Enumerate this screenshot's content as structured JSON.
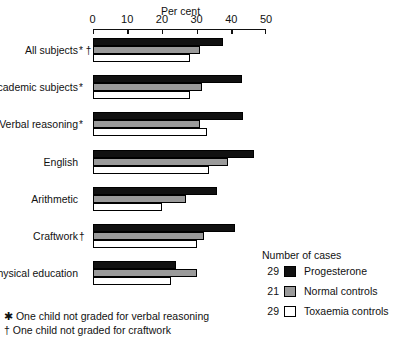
{
  "chart_data": {
    "type": "bar",
    "orientation": "horizontal",
    "title": "",
    "xlabel": "Per cent",
    "ylabel": "",
    "xlim": [
      0,
      50
    ],
    "xticks": [
      0,
      10,
      20,
      30,
      40,
      50
    ],
    "grid": false,
    "legend_position": "right-bottom",
    "categories": [
      "All subjects",
      "Academic subjects",
      "Verbal reasoning",
      "English",
      "Arithmetic",
      "Craftwork",
      "Physical education"
    ],
    "category_marks": [
      "* †",
      "*",
      "*",
      "",
      "",
      "†",
      ""
    ],
    "series": [
      {
        "name": "Progesterone",
        "n": 29,
        "color": "#111111",
        "values": [
          37.5,
          43.0,
          43.5,
          46.5,
          36.0,
          41.0,
          24.0
        ]
      },
      {
        "name": "Normal controls",
        "n": 21,
        "color": "#9a9a9a",
        "values": [
          31.0,
          31.5,
          31.0,
          39.0,
          27.0,
          32.0,
          30.0
        ]
      },
      {
        "name": "Toxaemia controls",
        "n": 29,
        "color": "#ffffff",
        "values": [
          28.0,
          28.0,
          33.0,
          33.5,
          20.0,
          30.0,
          22.5
        ]
      }
    ]
  },
  "axis": {
    "title": "Per cent",
    "tick_labels": [
      "0",
      "10",
      "20",
      "30",
      "40",
      "50"
    ]
  },
  "legend": {
    "title": "Number of cases",
    "rows": [
      {
        "count": "29",
        "label": "Progesterone",
        "swatch": "progesterone"
      },
      {
        "count": "21",
        "label": "Normal controls",
        "swatch": "normal"
      },
      {
        "count": "29",
        "label": "Toxaemia controls",
        "swatch": "toxaemia"
      }
    ]
  },
  "footnotes": [
    "✱ One child not graded for verbal reasoning",
    "† One child not graded for craftwork"
  ]
}
